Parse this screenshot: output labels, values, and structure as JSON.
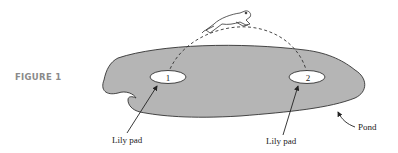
{
  "figure": {
    "label": "FIGURE 1",
    "pads": [
      {
        "number": "1",
        "label": "Lily pad"
      },
      {
        "number": "2",
        "label": "Lily pad"
      }
    ],
    "pond_label": "Pond",
    "colors": {
      "pond_fill": "#b5b5b5",
      "outline": "#333333",
      "pad_fill": "#ffffff",
      "figure_label": "#8a8a8a"
    }
  }
}
